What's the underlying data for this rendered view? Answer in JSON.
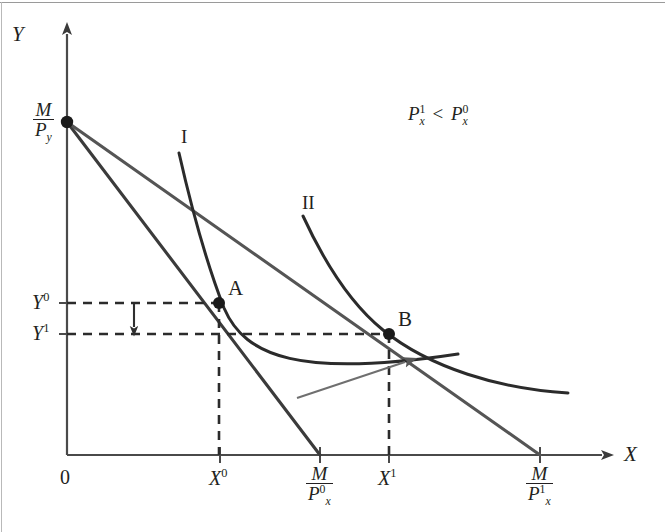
{
  "figure": {
    "type": "indifference-curve-budget-line-diagram",
    "title": "",
    "axes": {
      "x_label": "X",
      "y_label": "Y",
      "origin_label": "0"
    },
    "annotation": {
      "price_inequality": "P¹ₓ < P⁰ₓ",
      "price_inequality_parts": {
        "left_base": "P",
        "left_sup": "1",
        "left_sub": "x",
        "operator": "<",
        "right_base": "P",
        "right_sup": "0",
        "right_sub": "x"
      }
    },
    "y_intercept": {
      "name": "M-over-Py",
      "numerator": "M",
      "denominator_base": "P",
      "denominator_sub": "y"
    },
    "y_ticks": [
      {
        "id": "Y0",
        "base": "Y",
        "sup": "0",
        "value_px": 303
      },
      {
        "id": "Y1",
        "base": "Y",
        "sup": "1",
        "value_px": 334
      }
    ],
    "x_ticks": [
      {
        "id": "origin",
        "label": "0",
        "x_px": 67
      },
      {
        "id": "X0",
        "base": "X",
        "sup": "0",
        "x_px": 220
      },
      {
        "id": "M-over-Px0",
        "numerator": "M",
        "denominator_base": "P",
        "denominator_sup": "0",
        "denominator_sub": "x",
        "x_px": 320
      },
      {
        "id": "X1",
        "base": "X",
        "sup": "1",
        "x_px": 389
      },
      {
        "id": "M-over-Px1",
        "numerator": "M",
        "denominator_base": "P",
        "denominator_sup": "1",
        "denominator_sub": "x",
        "x_px": 540
      }
    ],
    "curves": [
      {
        "id": "I",
        "label": "I",
        "label_x": 187,
        "label_y": 137,
        "kind": "indifference-curve"
      },
      {
        "id": "II",
        "label": "II",
        "label_x": 310,
        "label_y": 202,
        "kind": "indifference-curve"
      }
    ],
    "budget_lines": [
      {
        "id": "budget-0",
        "from_px": [
          67,
          122
        ],
        "to_px": [
          320,
          455
        ],
        "price": "Px0"
      },
      {
        "id": "budget-1",
        "from_px": [
          67,
          122
        ],
        "to_px": [
          540,
          455
        ],
        "price": "Px1"
      }
    ],
    "points": [
      {
        "id": "A",
        "label": "A",
        "x_px": 219,
        "y_px": 303,
        "label_x": 230,
        "label_y": 280
      },
      {
        "id": "B",
        "label": "B",
        "x_px": 389,
        "y_px": 334,
        "label_x": 400,
        "label_y": 311
      }
    ],
    "arrows": [
      {
        "id": "income-effect-down",
        "kind": "down",
        "from_px": [
          134,
          305
        ],
        "to_px": [
          134,
          334
        ]
      },
      {
        "id": "substitution-effect",
        "kind": "curved",
        "from_px": [
          297,
          398
        ],
        "to_px": [
          412,
          359
        ]
      }
    ],
    "colors": {
      "ink": "#231f20",
      "axis": "#4a4a4a",
      "line": "#3b3b3b",
      "thin": "#6f6f6f",
      "border": "#9a9a9a"
    }
  }
}
